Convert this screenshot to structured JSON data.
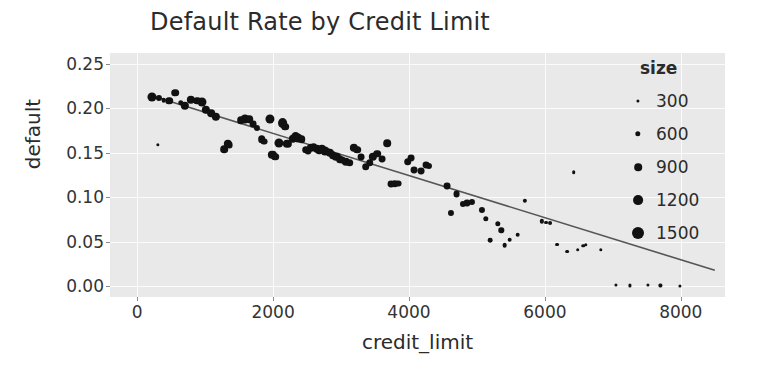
{
  "chart_data": {
    "type": "scatter",
    "title": "Default Rate by Credit Limit",
    "xlabel": "credit_limit",
    "ylabel": "default",
    "xlim": [
      -400,
      8650
    ],
    "ylim": [
      -0.012,
      0.262
    ],
    "xticks": [
      0,
      2000,
      4000,
      6000,
      8000
    ],
    "xticklabels": [
      "0",
      "2000",
      "4000",
      "6000",
      "8000"
    ],
    "yticks": [
      0.0,
      0.05,
      0.1,
      0.15,
      0.2,
      0.25
    ],
    "yticklabels": [
      "0.00",
      "0.05",
      "0.10",
      "0.15",
      "0.20",
      "0.25"
    ],
    "grid": true,
    "grid_color": "#fbfbfb",
    "plot_bg": "#e9e9e9",
    "figure_bg": "#ffffff",
    "marker_color": "#111111",
    "trendline": {
      "color": "#555555",
      "x_start": 250,
      "y_start": 0.213,
      "x_end": 8500,
      "y_end": 0.018
    },
    "size_legend": {
      "title": "size",
      "entries": [
        {
          "label": "300",
          "value": 300
        },
        {
          "label": "600",
          "value": 600
        },
        {
          "label": "900",
          "value": 900
        },
        {
          "label": "1200",
          "value": 1200
        },
        {
          "label": "1500",
          "value": 1500
        }
      ]
    },
    "size_range": [
      300,
      1500
    ],
    "points": [
      {
        "x": 210,
        "y": 0.213,
        "size": 1100
      },
      {
        "x": 320,
        "y": 0.212,
        "size": 700
      },
      {
        "x": 390,
        "y": 0.209,
        "size": 500
      },
      {
        "x": 470,
        "y": 0.2085,
        "size": 900
      },
      {
        "x": 560,
        "y": 0.2175,
        "size": 900
      },
      {
        "x": 640,
        "y": 0.206,
        "size": 600
      },
      {
        "x": 700,
        "y": 0.203,
        "size": 1000
      },
      {
        "x": 790,
        "y": 0.2095,
        "size": 1000
      },
      {
        "x": 880,
        "y": 0.2085,
        "size": 900
      },
      {
        "x": 960,
        "y": 0.2075,
        "size": 1100
      },
      {
        "x": 1010,
        "y": 0.1985,
        "size": 1000
      },
      {
        "x": 1090,
        "y": 0.1945,
        "size": 900
      },
      {
        "x": 1160,
        "y": 0.19,
        "size": 1000
      },
      {
        "x": 300,
        "y": 0.1585,
        "size": 320
      },
      {
        "x": 1280,
        "y": 0.154,
        "size": 900
      },
      {
        "x": 1330,
        "y": 0.16,
        "size": 1000
      },
      {
        "x": 1360,
        "y": 0.1585,
        "size": 800
      },
      {
        "x": 1520,
        "y": 0.1865,
        "size": 900
      },
      {
        "x": 1590,
        "y": 0.188,
        "size": 1100
      },
      {
        "x": 1650,
        "y": 0.1875,
        "size": 900
      },
      {
        "x": 1700,
        "y": 0.182,
        "size": 800
      },
      {
        "x": 1760,
        "y": 0.178,
        "size": 700
      },
      {
        "x": 1830,
        "y": 0.165,
        "size": 900
      },
      {
        "x": 1870,
        "y": 0.1625,
        "size": 800
      },
      {
        "x": 1950,
        "y": 0.188,
        "size": 1100
      },
      {
        "x": 1990,
        "y": 0.148,
        "size": 1000
      },
      {
        "x": 2030,
        "y": 0.1455,
        "size": 900
      },
      {
        "x": 2080,
        "y": 0.1615,
        "size": 1100
      },
      {
        "x": 2140,
        "y": 0.183,
        "size": 1200
      },
      {
        "x": 2175,
        "y": 0.1795,
        "size": 900
      },
      {
        "x": 2210,
        "y": 0.16,
        "size": 1000
      },
      {
        "x": 2290,
        "y": 0.166,
        "size": 1000
      },
      {
        "x": 2330,
        "y": 0.168,
        "size": 1200
      },
      {
        "x": 2370,
        "y": 0.1665,
        "size": 1100
      },
      {
        "x": 2420,
        "y": 0.165,
        "size": 900
      },
      {
        "x": 2480,
        "y": 0.1535,
        "size": 900
      },
      {
        "x": 2520,
        "y": 0.152,
        "size": 800
      },
      {
        "x": 2560,
        "y": 0.1555,
        "size": 1000
      },
      {
        "x": 2600,
        "y": 0.156,
        "size": 900
      },
      {
        "x": 2640,
        "y": 0.1545,
        "size": 1000
      },
      {
        "x": 2680,
        "y": 0.153,
        "size": 900
      },
      {
        "x": 2720,
        "y": 0.154,
        "size": 1000
      },
      {
        "x": 2760,
        "y": 0.152,
        "size": 1100
      },
      {
        "x": 2800,
        "y": 0.151,
        "size": 900
      },
      {
        "x": 2840,
        "y": 0.1495,
        "size": 1000
      },
      {
        "x": 2880,
        "y": 0.1475,
        "size": 900
      },
      {
        "x": 2930,
        "y": 0.1455,
        "size": 1000
      },
      {
        "x": 2980,
        "y": 0.143,
        "size": 900
      },
      {
        "x": 3020,
        "y": 0.142,
        "size": 800
      },
      {
        "x": 3070,
        "y": 0.14,
        "size": 1000
      },
      {
        "x": 3130,
        "y": 0.139,
        "size": 900
      },
      {
        "x": 3190,
        "y": 0.1555,
        "size": 1000
      },
      {
        "x": 3240,
        "y": 0.1535,
        "size": 900
      },
      {
        "x": 3300,
        "y": 0.1455,
        "size": 800
      },
      {
        "x": 3360,
        "y": 0.1345,
        "size": 900
      },
      {
        "x": 3420,
        "y": 0.139,
        "size": 900
      },
      {
        "x": 3470,
        "y": 0.1455,
        "size": 1000
      },
      {
        "x": 3530,
        "y": 0.149,
        "size": 900
      },
      {
        "x": 3600,
        "y": 0.143,
        "size": 800
      },
      {
        "x": 3680,
        "y": 0.1605,
        "size": 900
      },
      {
        "x": 3730,
        "y": 0.1145,
        "size": 800
      },
      {
        "x": 3790,
        "y": 0.1155,
        "size": 900
      },
      {
        "x": 3840,
        "y": 0.1155,
        "size": 800
      },
      {
        "x": 3980,
        "y": 0.14,
        "size": 900
      },
      {
        "x": 4030,
        "y": 0.144,
        "size": 800
      },
      {
        "x": 4080,
        "y": 0.1305,
        "size": 800
      },
      {
        "x": 4180,
        "y": 0.129,
        "size": 800
      },
      {
        "x": 4250,
        "y": 0.136,
        "size": 800
      },
      {
        "x": 4300,
        "y": 0.1355,
        "size": 700
      },
      {
        "x": 4560,
        "y": 0.113,
        "size": 800
      },
      {
        "x": 4620,
        "y": 0.082,
        "size": 700
      },
      {
        "x": 4700,
        "y": 0.104,
        "size": 800
      },
      {
        "x": 4790,
        "y": 0.093,
        "size": 700
      },
      {
        "x": 4860,
        "y": 0.0935,
        "size": 800
      },
      {
        "x": 4920,
        "y": 0.0945,
        "size": 700
      },
      {
        "x": 5080,
        "y": 0.086,
        "size": 700
      },
      {
        "x": 5130,
        "y": 0.076,
        "size": 600
      },
      {
        "x": 5190,
        "y": 0.052,
        "size": 500
      },
      {
        "x": 5310,
        "y": 0.0705,
        "size": 600
      },
      {
        "x": 5360,
        "y": 0.063,
        "size": 600
      },
      {
        "x": 5410,
        "y": 0.046,
        "size": 500
      },
      {
        "x": 5480,
        "y": 0.0525,
        "size": 500
      },
      {
        "x": 5600,
        "y": 0.058,
        "size": 500
      },
      {
        "x": 5700,
        "y": 0.096,
        "size": 450
      },
      {
        "x": 5960,
        "y": 0.073,
        "size": 450
      },
      {
        "x": 6020,
        "y": 0.0715,
        "size": 400
      },
      {
        "x": 6080,
        "y": 0.071,
        "size": 400
      },
      {
        "x": 6180,
        "y": 0.047,
        "size": 400
      },
      {
        "x": 6330,
        "y": 0.039,
        "size": 380
      },
      {
        "x": 6420,
        "y": 0.128,
        "size": 350
      },
      {
        "x": 6480,
        "y": 0.041,
        "size": 360
      },
      {
        "x": 6560,
        "y": 0.0455,
        "size": 360
      },
      {
        "x": 6600,
        "y": 0.047,
        "size": 340
      },
      {
        "x": 6820,
        "y": 0.041,
        "size": 330
      },
      {
        "x": 7050,
        "y": 0.0015,
        "size": 300
      },
      {
        "x": 7250,
        "y": 0.001,
        "size": 300
      },
      {
        "x": 7520,
        "y": 0.0012,
        "size": 300
      },
      {
        "x": 7700,
        "y": 0.001,
        "size": 300
      },
      {
        "x": 7980,
        "y": 0.0008,
        "size": 300
      }
    ]
  }
}
